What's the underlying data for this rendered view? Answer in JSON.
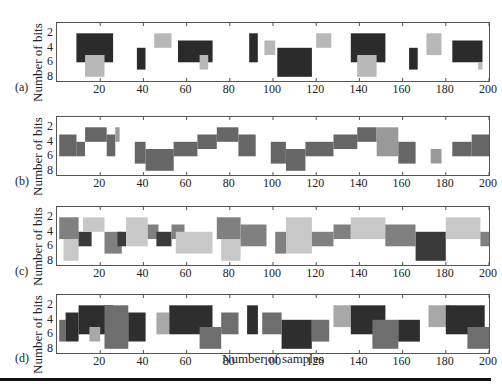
{
  "figure": {
    "xlabel": "Number of samples",
    "ylabel": "Number of bits",
    "panels": [
      {
        "id": "a",
        "label": "(a)",
        "top": 18
      },
      {
        "id": "b",
        "label": "(b)",
        "top": 112
      },
      {
        "id": "c",
        "label": "(c)",
        "top": 202
      },
      {
        "id": "d",
        "label": "(d)",
        "top": 290
      }
    ],
    "x_ticks": [
      "20",
      "40",
      "60",
      "80",
      "100",
      "120",
      "140",
      "160",
      "180",
      "200"
    ],
    "y_ticks": [
      "2",
      "4",
      "6",
      "8"
    ]
  },
  "chart_data": [
    {
      "type": "heatmap",
      "panel": "(a)",
      "title": "",
      "xlabel": "",
      "ylabel": "Number of bits",
      "xlim": [
        0,
        200
      ],
      "ylim": [
        8,
        1
      ],
      "x_ticks": [
        20,
        40,
        60,
        80,
        100,
        120,
        140,
        160,
        180,
        200
      ],
      "y_ticks": [
        2,
        4,
        6,
        8
      ],
      "colors": {
        "dark": "#2b2b2b",
        "mid": "#777777",
        "light": "#b8b8b8"
      },
      "blocks": [
        {
          "x0": 9,
          "x1": 26,
          "y0": 2,
          "y1": 6,
          "shade": "dark"
        },
        {
          "x0": 13,
          "x1": 22,
          "y0": 5,
          "y1": 8,
          "shade": "light"
        },
        {
          "x0": 37,
          "x1": 41,
          "y0": 4,
          "y1": 7,
          "shade": "dark"
        },
        {
          "x0": 45,
          "x1": 53,
          "y0": 2,
          "y1": 4,
          "shade": "light"
        },
        {
          "x0": 56,
          "x1": 72,
          "y0": 3,
          "y1": 6,
          "shade": "dark"
        },
        {
          "x0": 66,
          "x1": 70,
          "y0": 5,
          "y1": 7,
          "shade": "light"
        },
        {
          "x0": 89,
          "x1": 93,
          "y0": 2,
          "y1": 6,
          "shade": "dark"
        },
        {
          "x0": 96,
          "x1": 101,
          "y0": 3,
          "y1": 5,
          "shade": "light"
        },
        {
          "x0": 102,
          "x1": 118,
          "y0": 4,
          "y1": 8,
          "shade": "dark"
        },
        {
          "x0": 120,
          "x1": 127,
          "y0": 2,
          "y1": 4,
          "shade": "light"
        },
        {
          "x0": 136,
          "x1": 152,
          "y0": 2,
          "y1": 6,
          "shade": "dark"
        },
        {
          "x0": 139,
          "x1": 148,
          "y0": 5,
          "y1": 8,
          "shade": "light"
        },
        {
          "x0": 163,
          "x1": 167,
          "y0": 4,
          "y1": 7,
          "shade": "dark"
        },
        {
          "x0": 171,
          "x1": 178,
          "y0": 2,
          "y1": 5,
          "shade": "light"
        },
        {
          "x0": 183,
          "x1": 197,
          "y0": 3,
          "y1": 6,
          "shade": "dark"
        },
        {
          "x0": 195,
          "x1": 197,
          "y0": 6,
          "y1": 7,
          "shade": "light"
        }
      ]
    },
    {
      "type": "heatmap",
      "panel": "(b)",
      "ylabel": "Number of bits",
      "xlim": [
        0,
        200
      ],
      "ylim": [
        8,
        1
      ],
      "colors": {
        "dark": "#444444",
        "mid": "#666666",
        "light": "#999999"
      },
      "blocks": [
        {
          "x0": 1,
          "x1": 9,
          "y0": 3,
          "y1": 6,
          "shade": "mid"
        },
        {
          "x0": 9,
          "x1": 13,
          "y0": 4,
          "y1": 6,
          "shade": "mid"
        },
        {
          "x0": 13,
          "x1": 23,
          "y0": 2,
          "y1": 4,
          "shade": "mid"
        },
        {
          "x0": 23,
          "x1": 27,
          "y0": 3,
          "y1": 6,
          "shade": "mid"
        },
        {
          "x0": 27,
          "x1": 29,
          "y0": 2,
          "y1": 4,
          "shade": "light"
        },
        {
          "x0": 36,
          "x1": 41,
          "y0": 4,
          "y1": 7,
          "shade": "mid"
        },
        {
          "x0": 41,
          "x1": 54,
          "y0": 5,
          "y1": 8,
          "shade": "mid"
        },
        {
          "x0": 54,
          "x1": 65,
          "y0": 4,
          "y1": 6,
          "shade": "mid"
        },
        {
          "x0": 65,
          "x1": 74,
          "y0": 3,
          "y1": 5,
          "shade": "mid"
        },
        {
          "x0": 74,
          "x1": 84,
          "y0": 2,
          "y1": 4,
          "shade": "mid"
        },
        {
          "x0": 84,
          "x1": 92,
          "y0": 3,
          "y1": 6,
          "shade": "mid"
        },
        {
          "x0": 99,
          "x1": 106,
          "y0": 4,
          "y1": 7,
          "shade": "mid"
        },
        {
          "x0": 106,
          "x1": 115,
          "y0": 5,
          "y1": 8,
          "shade": "mid"
        },
        {
          "x0": 115,
          "x1": 128,
          "y0": 4,
          "y1": 6,
          "shade": "mid"
        },
        {
          "x0": 128,
          "x1": 139,
          "y0": 3,
          "y1": 5,
          "shade": "mid"
        },
        {
          "x0": 139,
          "x1": 148,
          "y0": 2,
          "y1": 4,
          "shade": "mid"
        },
        {
          "x0": 148,
          "x1": 158,
          "y0": 2,
          "y1": 6,
          "shade": "light"
        },
        {
          "x0": 158,
          "x1": 166,
          "y0": 4,
          "y1": 7,
          "shade": "mid"
        },
        {
          "x0": 173,
          "x1": 178,
          "y0": 5,
          "y1": 7,
          "shade": "light"
        },
        {
          "x0": 183,
          "x1": 192,
          "y0": 4,
          "y1": 6,
          "shade": "mid"
        },
        {
          "x0": 192,
          "x1": 200,
          "y0": 3,
          "y1": 6,
          "shade": "mid"
        }
      ]
    },
    {
      "type": "heatmap",
      "panel": "(c)",
      "ylabel": "Number of bits",
      "xlim": [
        0,
        200
      ],
      "ylim": [
        8,
        1
      ],
      "colors": {
        "dark": "#3a3a3a",
        "mid": "#808080",
        "light": "#c8c8c8"
      },
      "blocks": [
        {
          "x0": 1,
          "x1": 10,
          "y0": 2,
          "y1": 5,
          "shade": "mid"
        },
        {
          "x0": 3,
          "x1": 10,
          "y0": 5,
          "y1": 8,
          "shade": "light"
        },
        {
          "x0": 10,
          "x1": 16,
          "y0": 4,
          "y1": 6,
          "shade": "dark"
        },
        {
          "x0": 12,
          "x1": 22,
          "y0": 2,
          "y1": 4,
          "shade": "light"
        },
        {
          "x0": 22,
          "x1": 30,
          "y0": 4,
          "y1": 7,
          "shade": "mid"
        },
        {
          "x0": 28,
          "x1": 32,
          "y0": 4,
          "y1": 6,
          "shade": "dark"
        },
        {
          "x0": 32,
          "x1": 42,
          "y0": 2,
          "y1": 6,
          "shade": "light"
        },
        {
          "x0": 42,
          "x1": 47,
          "y0": 3,
          "y1": 5,
          "shade": "mid"
        },
        {
          "x0": 46,
          "x1": 53,
          "y0": 4,
          "y1": 6,
          "shade": "dark"
        },
        {
          "x0": 53,
          "x1": 59,
          "y0": 3,
          "y1": 5,
          "shade": "mid"
        },
        {
          "x0": 55,
          "x1": 72,
          "y0": 4,
          "y1": 7,
          "shade": "light"
        },
        {
          "x0": 74,
          "x1": 85,
          "y0": 2,
          "y1": 5,
          "shade": "mid"
        },
        {
          "x0": 76,
          "x1": 85,
          "y0": 5,
          "y1": 8,
          "shade": "light"
        },
        {
          "x0": 85,
          "x1": 97,
          "y0": 3,
          "y1": 6,
          "shade": "mid"
        },
        {
          "x0": 101,
          "x1": 106,
          "y0": 4,
          "y1": 7,
          "shade": "mid"
        },
        {
          "x0": 106,
          "x1": 118,
          "y0": 2,
          "y1": 7,
          "shade": "light"
        },
        {
          "x0": 118,
          "x1": 128,
          "y0": 4,
          "y1": 6,
          "shade": "mid"
        },
        {
          "x0": 128,
          "x1": 136,
          "y0": 3,
          "y1": 5,
          "shade": "mid"
        },
        {
          "x0": 136,
          "x1": 152,
          "y0": 2,
          "y1": 5,
          "shade": "light"
        },
        {
          "x0": 152,
          "x1": 166,
          "y0": 3,
          "y1": 6,
          "shade": "mid"
        },
        {
          "x0": 166,
          "x1": 180,
          "y0": 4,
          "y1": 8,
          "shade": "dark"
        },
        {
          "x0": 180,
          "x1": 196,
          "y0": 2,
          "y1": 5,
          "shade": "light"
        },
        {
          "x0": 196,
          "x1": 200,
          "y0": 4,
          "y1": 6,
          "shade": "mid"
        }
      ]
    },
    {
      "type": "heatmap",
      "panel": "(d)",
      "xlabel": "Number of samples",
      "ylabel": "Number of bits",
      "xlim": [
        0,
        200
      ],
      "ylim": [
        8,
        1
      ],
      "colors": {
        "dark": "#2e2e2e",
        "mid": "#6e6e6e",
        "light": "#a8a8a8"
      },
      "blocks": [
        {
          "x0": 1,
          "x1": 4,
          "y0": 4,
          "y1": 7,
          "shade": "mid"
        },
        {
          "x0": 4,
          "x1": 10,
          "y0": 3,
          "y1": 7,
          "shade": "dark"
        },
        {
          "x0": 10,
          "x1": 26,
          "y0": 2,
          "y1": 6,
          "shade": "dark"
        },
        {
          "x0": 15,
          "x1": 20,
          "y0": 5,
          "y1": 7,
          "shade": "light"
        },
        {
          "x0": 22,
          "x1": 33,
          "y0": 2,
          "y1": 8,
          "shade": "mid"
        },
        {
          "x0": 33,
          "x1": 41,
          "y0": 3,
          "y1": 7,
          "shade": "dark"
        },
        {
          "x0": 46,
          "x1": 52,
          "y0": 3,
          "y1": 6,
          "shade": "light"
        },
        {
          "x0": 52,
          "x1": 72,
          "y0": 2,
          "y1": 6,
          "shade": "dark"
        },
        {
          "x0": 66,
          "x1": 76,
          "y0": 5,
          "y1": 8,
          "shade": "mid"
        },
        {
          "x0": 76,
          "x1": 84,
          "y0": 3,
          "y1": 6,
          "shade": "mid"
        },
        {
          "x0": 88,
          "x1": 93,
          "y0": 2,
          "y1": 6,
          "shade": "dark"
        },
        {
          "x0": 95,
          "x1": 104,
          "y0": 3,
          "y1": 6,
          "shade": "mid"
        },
        {
          "x0": 104,
          "x1": 118,
          "y0": 4,
          "y1": 8,
          "shade": "dark"
        },
        {
          "x0": 118,
          "x1": 126,
          "y0": 4,
          "y1": 7,
          "shade": "mid"
        },
        {
          "x0": 128,
          "x1": 136,
          "y0": 2,
          "y1": 5,
          "shade": "light"
        },
        {
          "x0": 136,
          "x1": 152,
          "y0": 2,
          "y1": 6,
          "shade": "dark"
        },
        {
          "x0": 146,
          "x1": 158,
          "y0": 4,
          "y1": 8,
          "shade": "mid"
        },
        {
          "x0": 158,
          "x1": 168,
          "y0": 4,
          "y1": 7,
          "shade": "dark"
        },
        {
          "x0": 172,
          "x1": 182,
          "y0": 2,
          "y1": 5,
          "shade": "light"
        },
        {
          "x0": 180,
          "x1": 198,
          "y0": 2,
          "y1": 6,
          "shade": "dark"
        },
        {
          "x0": 190,
          "x1": 200,
          "y0": 5,
          "y1": 8,
          "shade": "mid"
        }
      ]
    }
  ]
}
